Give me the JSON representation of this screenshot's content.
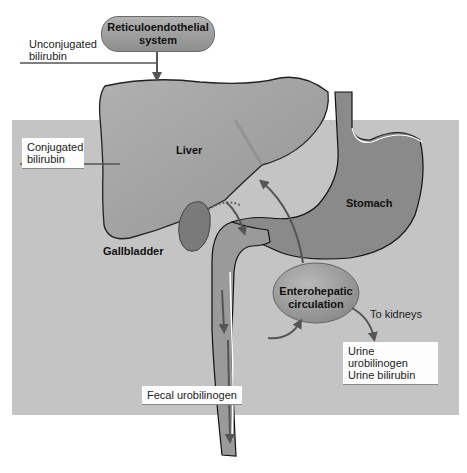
{
  "diagram": {
    "nodes": {
      "reticuloendothelial": {
        "line1": "Reticuloendothelial",
        "line2": "system"
      },
      "liver": "Liver",
      "stomach": "Stomach",
      "gallbladder": "Gallbladder",
      "enterohepatic": {
        "line1": "Enterohepatic",
        "line2": "circulation"
      }
    },
    "labels": {
      "unconjugated": {
        "line1": "Unconjugated",
        "line2": "bilirubin"
      },
      "conjugated": {
        "line1": "Conjugated",
        "line2": "bilirubin"
      },
      "to_kidneys": "To kidneys",
      "urine": {
        "line1": "Urine urobilinogen",
        "line2": "Urine bilirubin"
      },
      "fecal": "Fecal urobilinogen"
    },
    "colors": {
      "background_box": "#c4c4c4",
      "organ_fill": "#8a8a8a",
      "liver_fill": "#a2a2a2",
      "arrow": "#555555",
      "label_box": "#fdfdfd"
    },
    "edges": [
      {
        "from": "Reticuloendothelial system",
        "to": "Liver",
        "label": "Unconjugated bilirubin"
      },
      {
        "from": "Liver",
        "to": "Intestine",
        "label": "Conjugated bilirubin"
      },
      {
        "from": "Intestine",
        "to": "Enterohepatic circulation"
      },
      {
        "from": "Enterohepatic circulation",
        "to": "Liver"
      },
      {
        "from": "Enterohepatic circulation",
        "to": "Kidneys",
        "label": "To kidneys"
      },
      {
        "from": "Intestine",
        "to": "Feces",
        "label": "Fecal urobilinogen"
      }
    ]
  }
}
